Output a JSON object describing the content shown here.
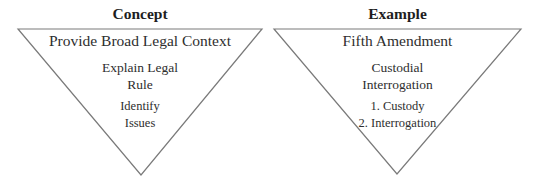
{
  "colors": {
    "stroke": "#7a7a7a",
    "text": "#2e2e2e",
    "heading": "#1e1e1e",
    "background": "#ffffff"
  },
  "panels": [
    {
      "heading": "Concept",
      "triangle": {
        "top_left": [
          18,
          29
        ],
        "top_right": [
          262,
          29
        ],
        "bottom": [
          141,
          175
        ]
      },
      "levels": [
        {
          "lines": [
            "Provide Broad Legal Context"
          ]
        },
        {
          "lines": [
            "Explain Legal",
            "Rule"
          ]
        },
        {
          "lines": [
            "Identify",
            "Issues"
          ]
        }
      ]
    },
    {
      "heading": "Example",
      "triangle": {
        "top_left": [
          274,
          29
        ],
        "top_right": [
          521,
          29
        ],
        "bottom": [
          397,
          174
        ]
      },
      "levels": [
        {
          "lines": [
            "Fifth Amendment"
          ]
        },
        {
          "lines": [
            "Custodial",
            "Interrogation"
          ]
        },
        {
          "lines": [
            "1. Custody",
            "2. Interrogation"
          ]
        }
      ]
    }
  ]
}
